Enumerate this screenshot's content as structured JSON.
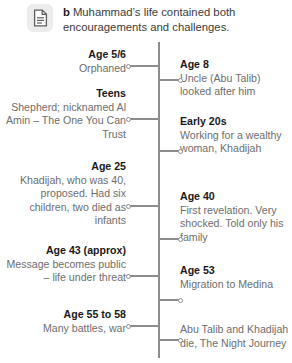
{
  "header": {
    "marker": "b",
    "text": "Muhammad’s life contained both encouragements and challenges.",
    "icon": "document-icon"
  },
  "timeline": {
    "axis_color": "#8c8c8c",
    "heading_color": "#181818",
    "body_color": "#6d6d6d",
    "entries": [
      {
        "side": "left",
        "heading": "Age 5/6",
        "body": "Orphaned",
        "top": 6,
        "connector_top": 23,
        "connector_width": 30
      },
      {
        "side": "right",
        "heading": "Age 8",
        "body": "Uncle (Abu Talib) looked after him",
        "top": 16,
        "connector_top": 37,
        "connector_width": 22
      },
      {
        "side": "left",
        "heading": "Teens",
        "body": "Shepherd; nicknamed Al Amin – The One You Can Trust",
        "top": 45,
        "connector_top": 76,
        "connector_width": 30
      },
      {
        "side": "right",
        "heading": "Early 20s",
        "body": "Working for a wealthy woman, Khadijah",
        "top": 73,
        "connector_top": 108,
        "connector_width": 22
      },
      {
        "side": "left",
        "heading": "Age 25",
        "body": "Khadijah, who was 40, proposed. Had six children, two died as infants",
        "top": 118,
        "connector_top": 163,
        "connector_width": 30
      },
      {
        "side": "right",
        "heading": "Age 40",
        "body": "First revelation. Very shocked. Told only his family",
        "top": 148,
        "connector_top": 196,
        "connector_width": 22
      },
      {
        "side": "left",
        "heading": "Age 43 (approx)",
        "body": "Message becomes public – life under threat",
        "top": 202,
        "connector_top": 233,
        "connector_width": 30
      },
      {
        "side": "right",
        "heading": "Age 53",
        "body": "Migration to Medina",
        "top": 222,
        "connector_top": 257,
        "connector_width": 22
      },
      {
        "side": "left",
        "heading": "Age 55 to 58",
        "body": "Many battles, war",
        "top": 266,
        "connector_top": 283,
        "connector_width": 30
      },
      {
        "side": "right",
        "heading": "",
        "body": "Abu Talib and Khadijah die, The Night Journey",
        "top": 281,
        "connector_top": 297,
        "connector_width": 22
      }
    ]
  }
}
